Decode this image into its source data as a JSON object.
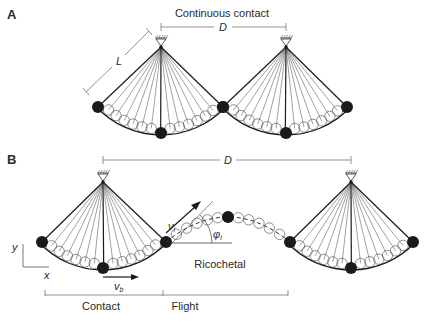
{
  "colors": {
    "ink": "#1a1a1a",
    "line": "#333333",
    "thin": "#555555",
    "bracket": "#777777",
    "background": "#ffffff"
  },
  "panel_a": {
    "label": "A",
    "caption": "Continuous contact",
    "distance_label": "D",
    "length_label": "L",
    "pendulums": [
      {
        "pivot": [
          161,
          47
        ],
        "left_ball": [
          98,
          107
        ],
        "bottom_ball": [
          161,
          133
        ],
        "right_ball": [
          223,
          107
        ]
      },
      {
        "pivot": [
          286,
          47
        ],
        "left_ball": [
          223,
          107
        ],
        "bottom_ball": [
          286,
          133
        ],
        "right_ball": [
          347,
          107
        ]
      }
    ],
    "distance_bar": {
      "x1": 161,
      "x2": 286,
      "y": 27
    },
    "length_bar": {
      "x1": 88,
      "y1": 91,
      "x2": 148,
      "y2": 31
    }
  },
  "panel_b": {
    "label": "B",
    "distance_label": "D",
    "ricochet_label": "Ricochetal",
    "velocity_initial_label": "v",
    "velocity_initial_sub": "i",
    "angle_label": "φ",
    "angle_sub": "i",
    "velocity_body_label": "v",
    "velocity_body_sub": "b",
    "axis_x_label": "x",
    "axis_y_label": "y",
    "phases": [
      {
        "label": "Contact",
        "x1": 45,
        "x2": 163
      },
      {
        "label": "Flight",
        "x1": 163,
        "x2": 288
      }
    ],
    "pendulums": [
      {
        "pivot": [
          103,
          182
        ],
        "left_ball": [
          42,
          242
        ],
        "bottom_ball": [
          103,
          268
        ],
        "right_ball": [
          166,
          242
        ]
      },
      {
        "pivot": [
          351,
          182
        ],
        "left_ball": [
          290,
          242
        ],
        "bottom_ball": [
          351,
          268
        ],
        "right_ball": [
          413,
          242
        ]
      }
    ],
    "flight_apex_ball": [
      228,
      217
    ],
    "distance_bar": {
      "x1": 103,
      "x2": 351,
      "y": 160
    }
  }
}
